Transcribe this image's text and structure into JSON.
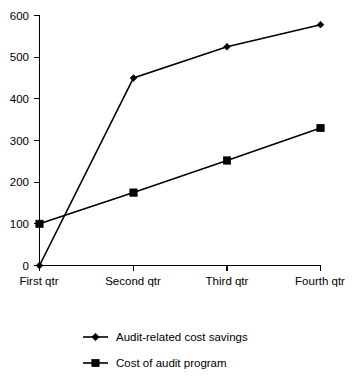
{
  "chart_data": {
    "type": "line",
    "title": "",
    "subtitle": "",
    "xlabel": "",
    "ylabel": "",
    "categories": [
      "First qtr",
      "Second qtr",
      "Third qtr",
      "Fourth qtr"
    ],
    "series": [
      {
        "name": "Audit-related cost savings",
        "marker": "diamond",
        "color": "#000000",
        "values": [
          0,
          450,
          525,
          578
        ]
      },
      {
        "name": "Cost of audit program",
        "marker": "square",
        "color": "#000000",
        "values": [
          100,
          175,
          252,
          330
        ]
      }
    ],
    "ylim": [
      0,
      600
    ],
    "ytick_values": [
      0,
      100,
      200,
      300,
      400,
      500,
      600
    ],
    "ytick_labels": [
      "0",
      "100",
      "200",
      "300",
      "400",
      "500",
      "600"
    ],
    "grid": false,
    "legend_position": "bottom-left",
    "background_color": "#ffffff",
    "axis_color": "#000000"
  },
  "axis": {
    "y_labels": {
      "t600": "600",
      "t500": "500",
      "t400": "400",
      "t300": "300",
      "t200": "200",
      "t100": "100",
      "t0": "0"
    },
    "x_labels": {
      "c0": "First qtr",
      "c1": "Second qtr",
      "c2": "Third qtr",
      "c3": "Fourth qtr"
    }
  },
  "legend": {
    "items": [
      {
        "label": "Audit-related cost savings",
        "marker": "diamond"
      },
      {
        "label": "Cost of audit program",
        "marker": "square"
      }
    ]
  }
}
